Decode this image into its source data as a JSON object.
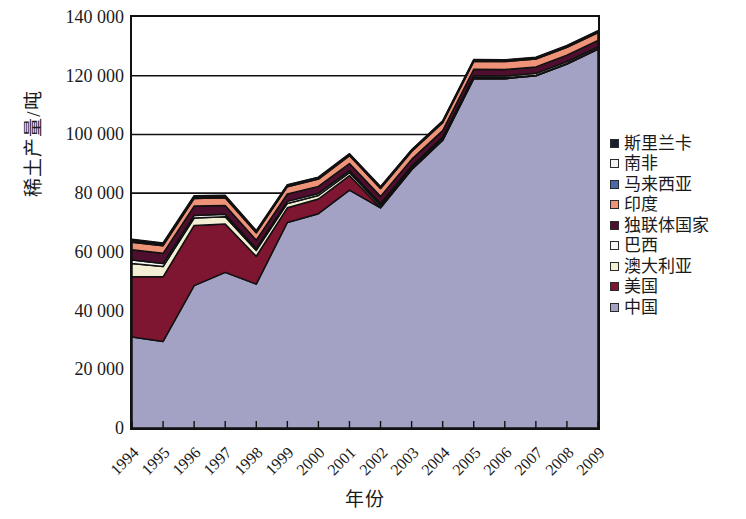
{
  "chart_data": {
    "type": "area",
    "stacked": true,
    "title": "",
    "xlabel": "年份",
    "ylabel": "稀土产量/吨",
    "grid": true,
    "grid_axis": "y",
    "legend_position": "right",
    "ylim": [
      0,
      140000
    ],
    "yticks": [
      0,
      20000,
      40000,
      60000,
      80000,
      100000,
      120000,
      140000
    ],
    "ytick_labels": [
      "0",
      "20 000",
      "40 000",
      "60 000",
      "80 000",
      "100 000",
      "120 000",
      "140 000"
    ],
    "categories": [
      1994,
      1995,
      1996,
      1997,
      1998,
      1999,
      2000,
      2001,
      2002,
      2003,
      2004,
      2005,
      2006,
      2007,
      2008,
      2009
    ],
    "xtick_labels": [
      "1994",
      "1995",
      "1996",
      "1997",
      "1998",
      "1999",
      "2000",
      "2001",
      "2002",
      "2003",
      "2004",
      "2005",
      "2006",
      "2007",
      "2008",
      "2009"
    ],
    "series": [
      {
        "name": "中国",
        "color": "#a3a2c4",
        "values": [
          31000,
          29500,
          48500,
          53000,
          49000,
          70000,
          73000,
          81000,
          75000,
          88000,
          98000,
          119000,
          119000,
          120000,
          124000,
          129000
        ]
      },
      {
        "name": "美国",
        "color": "#7e1632",
        "values": [
          20500,
          22000,
          20500,
          16500,
          9500,
          5000,
          5000,
          5000,
          0,
          0,
          0,
          0,
          0,
          0,
          0,
          0
        ]
      },
      {
        "name": "澳大利亚",
        "color": "#f2efd5",
        "values": [
          4500,
          3500,
          2500,
          2500,
          2000,
          1500,
          1200,
          1000,
          800,
          600,
          500,
          400,
          300,
          200,
          200,
          200
        ]
      },
      {
        "name": "巴西",
        "color": "#f7f7f7",
        "values": [
          1200,
          1000,
          900,
          800,
          700,
          700,
          700,
          700,
          700,
          600,
          600,
          600,
          600,
          600,
          600,
          600
        ]
      },
      {
        "name": "独联体国家",
        "color": "#4e0e2e",
        "values": [
          3500,
          3500,
          3200,
          3000,
          2800,
          2500,
          2400,
          2400,
          2400,
          2300,
          2200,
          2200,
          2200,
          2200,
          2200,
          2200
        ]
      },
      {
        "name": "印度",
        "color": "#ee9278",
        "values": [
          2600,
          2600,
          2600,
          2600,
          2500,
          2500,
          2500,
          2700,
          2700,
          2700,
          2700,
          2700,
          2700,
          2700,
          2700,
          2700
        ]
      },
      {
        "name": "马来西亚",
        "color": "#4a6aa8",
        "values": [
          500,
          450,
          400,
          400,
          350,
          300,
          300,
          300,
          300,
          250,
          250,
          250,
          250,
          250,
          250,
          250
        ]
      },
      {
        "name": "南非",
        "color": "#f2f2f2",
        "values": [
          300,
          300,
          300,
          250,
          250,
          200,
          200,
          200,
          200,
          200,
          200,
          200,
          200,
          200,
          200,
          200
        ]
      },
      {
        "name": "斯里兰卡",
        "color": "#1a1f33",
        "values": [
          200,
          200,
          200,
          200,
          150,
          150,
          150,
          150,
          150,
          150,
          150,
          150,
          150,
          150,
          150,
          150
        ]
      }
    ]
  },
  "legend": {
    "items": [
      {
        "label": "斯里兰卡",
        "color": "#1a1f33"
      },
      {
        "label": "南非",
        "color": "#f2f2f2"
      },
      {
        "label": "马来西亚",
        "color": "#4a6aa8"
      },
      {
        "label": "印度",
        "color": "#ee9278"
      },
      {
        "label": "独联体国家",
        "color": "#4e0e2e"
      },
      {
        "label": "巴西",
        "color": "#f7f7f7"
      },
      {
        "label": "澳大利亚",
        "color": "#f2efd5"
      },
      {
        "label": "美国",
        "color": "#7e1632"
      },
      {
        "label": "中国",
        "color": "#a3a2c4"
      }
    ]
  },
  "axes": {
    "y_title": "稀土产量/吨",
    "x_title": "年份"
  }
}
